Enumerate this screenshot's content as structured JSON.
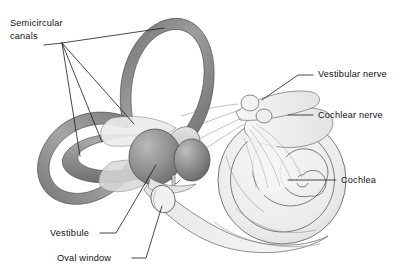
{
  "figure": {
    "background_color": "#ffffff",
    "width": 406,
    "height": 277
  },
  "labels": [
    {
      "id": "semicircular-canals",
      "line1": "Semicircular",
      "line2": "canals",
      "x": 10,
      "y": 26,
      "color": "#111111"
    },
    {
      "id": "vestibular-nerve",
      "text": "Vestibular nerve",
      "x": 318,
      "y": 77,
      "color": "#111111"
    },
    {
      "id": "cochlear-nerve",
      "text": "Cochlear nerve",
      "x": 318,
      "y": 118,
      "color": "#111111"
    },
    {
      "id": "cochlea",
      "text": "Cochlea",
      "x": 341,
      "y": 183,
      "color": "#111111"
    },
    {
      "id": "vestibule",
      "text": "Vestibule",
      "x": 50,
      "y": 236,
      "color": "#111111"
    },
    {
      "id": "oval-window",
      "text": "Oval window",
      "x": 57,
      "y": 261,
      "color": "#111111"
    }
  ],
  "structures": [
    {
      "id": "superior-semicircular-canal",
      "name": "Superior semicircular canal",
      "shade": "#8a8a8a"
    },
    {
      "id": "posterior-semicircular-canal",
      "name": "Posterior semicircular canal",
      "shade": "#8f8f8f"
    },
    {
      "id": "lateral-semicircular-canal",
      "name": "Lateral semicircular canal",
      "shade": "#9c9c9c"
    },
    {
      "id": "utricle",
      "name": "Utricle",
      "shade": "#8e8e8e"
    },
    {
      "id": "saccule",
      "name": "Saccule",
      "shade": "#8a8a8a"
    },
    {
      "id": "cochlea-spiral",
      "name": "Cochlea",
      "shade": "#ededed"
    },
    {
      "id": "nerve-bundle",
      "name": "Vestibulocochlear nerve bundle",
      "shade": "#f3f3f3"
    },
    {
      "id": "oval-window-structure",
      "name": "Oval window",
      "shade": "#efefef"
    }
  ],
  "palette": {
    "outline": "#4a4a4a",
    "dark_tube": "#7e7e7e",
    "mid_gray": "#9a9a9a",
    "light_gray": "#e9e9e9",
    "pale": "#f4f4f4",
    "text": "#111111"
  }
}
